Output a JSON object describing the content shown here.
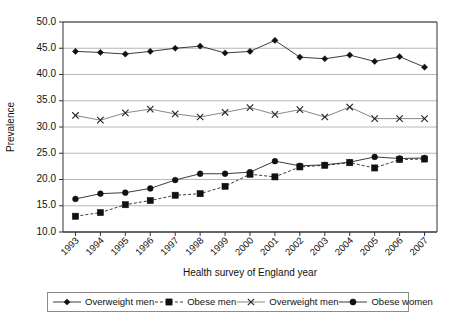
{
  "chart_data": {
    "type": "line",
    "title": "",
    "xlabel": "Health survey of England year",
    "ylabel": "Prevalence",
    "categories": [
      "1993",
      "1994",
      "1995",
      "1996",
      "1997",
      "1998",
      "1999",
      "2000",
      "2001",
      "2002",
      "2003",
      "2004",
      "2005",
      "2006",
      "2007"
    ],
    "x": [
      1993,
      1994,
      1995,
      1996,
      1997,
      1998,
      1999,
      2000,
      2001,
      2002,
      2003,
      2004,
      2005,
      2006,
      2007
    ],
    "ylim": [
      10.0,
      50.0
    ],
    "yticks": [
      "10.0",
      "15.0",
      "20.0",
      "25.0",
      "30.0",
      "35.0",
      "40.0",
      "45.0",
      "50.0"
    ],
    "ytick_values": [
      10.0,
      15.0,
      20.0,
      25.0,
      30.0,
      35.0,
      40.0,
      45.0,
      50.0
    ],
    "grid": true,
    "legend_position": "bottom",
    "series": [
      {
        "name": "Overweight men",
        "marker": "diamond",
        "line_style": "solid",
        "values": [
          44.4,
          44.2,
          43.9,
          44.4,
          45.0,
          45.4,
          44.1,
          44.4,
          46.5,
          43.3,
          43.0,
          43.7,
          42.5,
          43.4,
          41.4
        ]
      },
      {
        "name": "Obese men",
        "marker": "square",
        "line_style": "dashed",
        "values": [
          13.0,
          13.7,
          15.2,
          16.0,
          17.0,
          17.3,
          18.7,
          21.0,
          20.5,
          22.4,
          22.7,
          23.2,
          22.2,
          23.8,
          23.9
        ]
      },
      {
        "name": "Overweight men",
        "marker": "x",
        "line_style": "solid-thin",
        "values": [
          32.2,
          31.3,
          32.7,
          33.4,
          32.5,
          31.9,
          32.8,
          33.7,
          32.4,
          33.3,
          31.9,
          33.8,
          31.6,
          31.6,
          31.6
        ]
      },
      {
        "name": "Obese women",
        "marker": "circle",
        "line_style": "solid",
        "values": [
          16.3,
          17.3,
          17.5,
          18.3,
          19.9,
          21.1,
          21.1,
          21.4,
          23.5,
          22.6,
          22.8,
          23.3,
          24.3,
          24.0,
          24.1
        ]
      }
    ]
  },
  "legend": {
    "items": [
      {
        "label": "Overweight men",
        "marker": "diamond",
        "line_style": "solid"
      },
      {
        "label": "Obese men",
        "marker": "square",
        "line_style": "dashed"
      },
      {
        "label": "Overweight men",
        "marker": "x",
        "line_style": "solid-thin"
      },
      {
        "label": "Obese women",
        "marker": "circle",
        "line_style": "solid"
      }
    ]
  }
}
